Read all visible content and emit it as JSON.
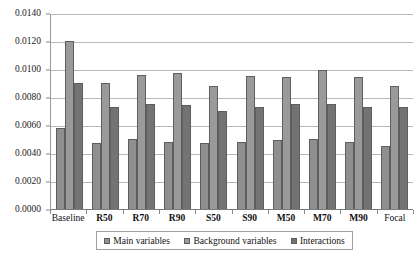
{
  "chart_data": {
    "type": "bar",
    "title": "",
    "xlabel": "",
    "ylabel": "",
    "ylim": [
      0,
      0.014
    ],
    "ytick_labels": [
      "0.0140",
      "0.0120",
      "0.0100",
      "0.0080",
      "0.0060",
      "0.0040",
      "0.0020",
      "0.0000"
    ],
    "ytick_values": [
      0.014,
      0.012,
      0.01,
      0.008,
      0.006,
      0.004,
      0.002,
      0
    ],
    "grid": true,
    "legend_position": "bottom",
    "categories": [
      "Baseline",
      "R50",
      "R70",
      "R90",
      "S50",
      "S90",
      "M50",
      "M70",
      "M90",
      "Focal"
    ],
    "series": [
      {
        "name": "Main variables",
        "color": "#8f8f8f",
        "values": [
          0.0058,
          0.0047,
          0.005,
          0.0048,
          0.0047,
          0.0048,
          0.0049,
          0.005,
          0.0048,
          0.0045
        ]
      },
      {
        "name": "Background variables",
        "color": "#9a9a9a",
        "values": [
          0.012,
          0.009,
          0.0096,
          0.0097,
          0.0088,
          0.0095,
          0.0094,
          0.0099,
          0.0094,
          0.0088
        ]
      },
      {
        "name": "Interactions",
        "color": "#737373",
        "values": [
          0.009,
          0.0073,
          0.0075,
          0.0074,
          0.007,
          0.0073,
          0.0075,
          0.0075,
          0.0073,
          0.0073
        ]
      }
    ]
  },
  "axis": {
    "y_labels": [
      "0.0140",
      "0.0120",
      "0.0100",
      "0.0080",
      "0.0060",
      "0.0040",
      "0.0020",
      "0.0000"
    ],
    "x_labels": [
      "Baseline",
      "R50",
      "R70",
      "R90",
      "S50",
      "S90",
      "M50",
      "M70",
      "M90",
      "Focal"
    ]
  },
  "legend": {
    "items": [
      {
        "label": "Main variables"
      },
      {
        "label": "Background variables"
      },
      {
        "label": "Interactions"
      }
    ]
  }
}
